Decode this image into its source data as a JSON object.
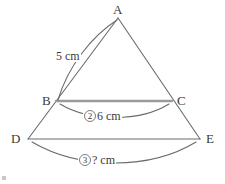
{
  "figure": {
    "stroke_color": "#6b6b6b",
    "highlight_color": "#9a9a9a",
    "text_color": "#3a3a3a",
    "background": "#ffffff",
    "vertices": [
      {
        "id": "A",
        "label": "A",
        "x": 118,
        "y": 18,
        "label_x": 113,
        "label_y": 3
      },
      {
        "id": "B",
        "label": "B",
        "x": 56,
        "y": 101,
        "label_x": 42,
        "label_y": 94
      },
      {
        "id": "C",
        "label": "C",
        "x": 172,
        "y": 101,
        "label_x": 177,
        "label_y": 94
      },
      {
        "id": "D",
        "label": "D",
        "x": 28,
        "y": 139,
        "label_x": 11,
        "label_y": 132
      },
      {
        "id": "E",
        "label": "E",
        "x": 200,
        "y": 139,
        "label_x": 206,
        "label_y": 132
      }
    ],
    "segments": [
      {
        "name": "segment-A-D",
        "from": "A",
        "to": "D",
        "emphasis": "normal"
      },
      {
        "name": "segment-A-E",
        "from": "A",
        "to": "E",
        "emphasis": "normal"
      },
      {
        "name": "segment-B-C",
        "from": "B",
        "to": "C",
        "emphasis": "bold"
      },
      {
        "name": "segment-D-E",
        "from": "D",
        "to": "E",
        "emphasis": "normal"
      }
    ],
    "measures": [
      {
        "name": "measure-ab",
        "marker": "",
        "value": "5 cm",
        "text_x": 55,
        "text_y": 50,
        "arc": "M 117 20 C 92 36, 68 66, 58 100"
      },
      {
        "name": "measure-bc",
        "marker": "2",
        "value": "6 cm",
        "text_x": 83,
        "text_y": 110,
        "arc": "M 60 104 C 90 122, 140 122, 169 104"
      },
      {
        "name": "measure-de",
        "marker": "3",
        "value": "? cm",
        "text_x": 78,
        "text_y": 154,
        "arc": "M 32 142 C 80 170, 150 170, 196 142"
      }
    ]
  }
}
